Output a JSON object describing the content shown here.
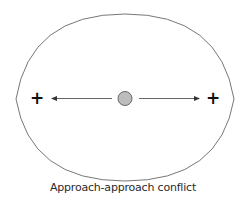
{
  "diagram": {
    "type": "approach-approach conflict",
    "boundary": {
      "shape": "lens",
      "stroke": "#777777"
    },
    "person": {
      "label": "",
      "fill": "#bdbdbd",
      "stroke": "#666666"
    },
    "goals": [
      {
        "side": "left",
        "valence": "+"
      },
      {
        "side": "right",
        "valence": "+"
      }
    ],
    "arrows": [
      {
        "direction": "left",
        "to": "left goal"
      },
      {
        "direction": "right",
        "to": "right goal"
      }
    ],
    "caption": "Approach-approach conflict"
  }
}
